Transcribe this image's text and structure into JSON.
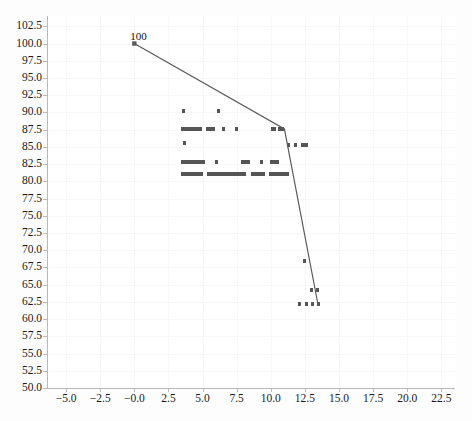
{
  "chart_data": {
    "type": "scatter",
    "title": "",
    "xlabel": "",
    "ylabel": "",
    "xlim": [
      -6.4,
      23.5
    ],
    "ylim": [
      50.0,
      104.0
    ],
    "grid": true,
    "legend": null,
    "xticks": [
      "-5.0",
      "-2.5",
      "-0.0",
      "2.5",
      "5.0",
      "7.5",
      "10.0",
      "12.5",
      "15.0",
      "17.5",
      "20.0",
      "22.5"
    ],
    "xtick_values": [
      -5.0,
      -2.5,
      0.0,
      2.5,
      5.0,
      7.5,
      10.0,
      12.5,
      15.0,
      17.5,
      20.0,
      22.5
    ],
    "yticks": [
      "50.0",
      "52.5",
      "55.0",
      "57.5",
      "60.0",
      "62.5",
      "65.0",
      "67.5",
      "70.0",
      "72.5",
      "75.0",
      "77.5",
      "80.0",
      "82.5",
      "85.0",
      "87.5",
      "90.0",
      "92.5",
      "95.0",
      "97.5",
      "100.0",
      "102.5"
    ],
    "ytick_values": [
      50.0,
      52.5,
      55.0,
      57.5,
      60.0,
      62.5,
      65.0,
      67.5,
      70.0,
      72.5,
      75.0,
      77.5,
      80.0,
      82.5,
      85.0,
      87.5,
      90.0,
      92.5,
      95.0,
      97.5,
      100.0,
      102.5
    ],
    "annotations": [
      {
        "text": "100",
        "x": 0.0,
        "y": 100.0,
        "dx": -4,
        "dy": -14
      }
    ],
    "series": [
      {
        "name": "frontier-line",
        "kind": "line",
        "color": "#5a5a5a",
        "points": [
          {
            "x": 0.0,
            "y": 100.0
          },
          {
            "x": 11.0,
            "y": 87.6
          },
          {
            "x": 13.45,
            "y": 62.2
          }
        ]
      },
      {
        "name": "observations",
        "kind": "scatter",
        "color": "#555555",
        "marker": "square",
        "rows": [
          {
            "y": 90.2,
            "segments": [
              [
                3.5,
                3.7
              ],
              [
                6.05,
                6.25
              ]
            ]
          },
          {
            "y": 87.6,
            "segments": [
              [
                3.4,
                4.95
              ],
              [
                5.25,
                5.9
              ],
              [
                6.45,
                6.65
              ],
              [
                7.4,
                7.6
              ],
              [
                10.0,
                10.35
              ],
              [
                10.55,
                11.0
              ]
            ]
          },
          {
            "y": 85.6,
            "segments": [
              [
                3.55,
                3.8
              ]
            ]
          },
          {
            "y": 85.3,
            "segments": [
              [
                11.2,
                11.35
              ],
              [
                11.7,
                11.9
              ],
              [
                12.2,
                12.75
              ]
            ]
          },
          {
            "y": 82.8,
            "segments": [
              [
                3.4,
                5.15
              ],
              [
                5.9,
                6.05
              ],
              [
                7.85,
                8.5
              ],
              [
                9.2,
                9.4
              ],
              [
                9.95,
                10.6
              ]
            ]
          },
          {
            "y": 81.1,
            "segments": [
              [
                3.45,
                5.05
              ],
              [
                5.35,
                8.2
              ],
              [
                8.55,
                9.6
              ],
              [
                9.9,
                11.3
              ]
            ]
          },
          {
            "y": 68.5,
            "segments": [
              [
                12.35,
                12.55
              ]
            ]
          },
          {
            "y": 64.2,
            "segments": [
              [
                12.85,
                13.05
              ],
              [
                13.3,
                13.55
              ]
            ]
          },
          {
            "y": 62.2,
            "segments": [
              [
                12.0,
                12.2
              ],
              [
                12.5,
                12.7
              ],
              [
                12.95,
                13.2
              ],
              [
                13.4,
                13.6
              ]
            ]
          }
        ]
      }
    ]
  },
  "colors": {
    "line": "#5a5a5a",
    "marker": "#555555",
    "axis": "#b9b9b9",
    "grid": "#f7f7f7",
    "text": "#1a1a1a",
    "plot_bg": "#ffffff",
    "figure_bg": "#fdfdfd"
  }
}
